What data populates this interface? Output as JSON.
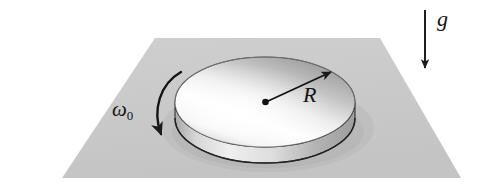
{
  "figure": {
    "background_color": "#ffffff"
  },
  "labels": {
    "angular_velocity": {
      "symbol": "ω",
      "subscript": "0",
      "text": "ω₀",
      "meaning": "initial angular velocity of the disk"
    },
    "radius": {
      "text": "R",
      "meaning": "radius of the disk"
    },
    "gravity": {
      "text": "g",
      "meaning": "gravitational acceleration, directed downward"
    }
  },
  "objects": {
    "plane": {
      "name": "horizontal-ground-plane",
      "fill": "#c9c9c9",
      "corners": [
        [
          155,
          38
        ],
        [
          380,
          38
        ],
        [
          461,
          178
        ],
        [
          62,
          178
        ]
      ]
    },
    "disk": {
      "name": "spinning-disk",
      "top_face_fill_light": "#ffffff",
      "top_face_fill_dark": "#9a9a9a",
      "rim_fill": "#bdbdbd",
      "outline": "#3a3a3a",
      "center": [
        265,
        102
      ],
      "radius_x": 90,
      "radius_y": 45,
      "thickness": 16
    },
    "radius_arrow": {
      "name": "radius-arrow",
      "color": "#1a1a1a",
      "from": [
        265,
        102
      ],
      "to": [
        333,
        71
      ]
    },
    "spin_arrow": {
      "name": "spin-direction-arrow",
      "color": "#1a1a1a",
      "direction": "counterclockwise-viewed-from-above",
      "start": [
        181,
        72
      ],
      "end": [
        166,
        142
      ]
    },
    "gravity_arrow": {
      "name": "gravity-arrow",
      "color": "#1a1a1a",
      "from": [
        425,
        10
      ],
      "to": [
        425,
        72
      ]
    }
  }
}
